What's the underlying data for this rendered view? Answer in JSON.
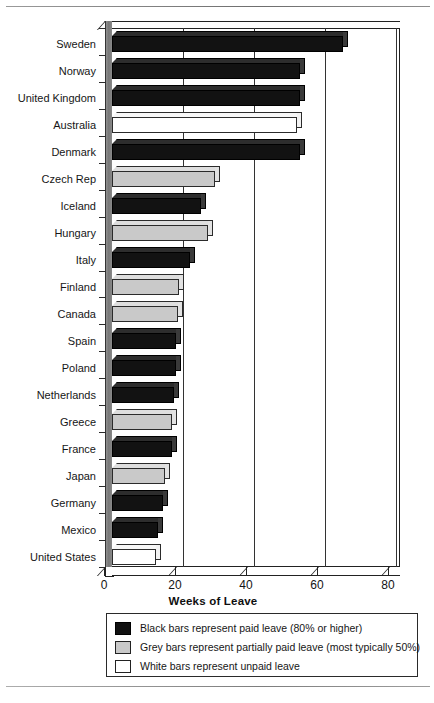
{
  "chart_data": {
    "type": "bar",
    "orientation": "horizontal",
    "title": "",
    "xlabel": "Weeks of Leave",
    "ylabel": "",
    "xlim": [
      0,
      80
    ],
    "xticks": [
      0,
      20,
      40,
      60,
      80
    ],
    "grid": "vertical",
    "legend_position": "below-axis",
    "categories": [
      "Sweden",
      "Norway",
      "United Kingdom",
      "Australia",
      "Denmark",
      "Czech Rep",
      "Iceland",
      "Hungary",
      "Italy",
      "Finland",
      "Canada",
      "Spain",
      "Poland",
      "Netherlands",
      "Greece",
      "France",
      "Japan",
      "Germany",
      "Mexico",
      "United States"
    ],
    "values": [
      65,
      53,
      53,
      52,
      53,
      29,
      25,
      27,
      22,
      19,
      18.5,
      18,
      18,
      17.5,
      17,
      17,
      15,
      14.5,
      13,
      12.5
    ],
    "bar_types": [
      "black",
      "black",
      "black",
      "white",
      "black",
      "grey",
      "black",
      "grey",
      "black",
      "grey",
      "grey",
      "black",
      "black",
      "black",
      "grey",
      "black",
      "grey",
      "black",
      "black",
      "white"
    ],
    "series": [
      {
        "name": "Black bars represent paid leave (80% or higher)",
        "color": "#121212"
      },
      {
        "name": "Grey bars represent partially paid leave (most typically 50%)",
        "color": "#c9c9c9"
      },
      {
        "name": "White bars represent unpaid leave",
        "color": "#ffffff"
      }
    ]
  },
  "axis": {
    "x_title": "Weeks of Leave",
    "tick_labels": [
      "0",
      "20",
      "40",
      "60",
      "80"
    ]
  },
  "legend": {
    "rows": [
      {
        "swatch": "black",
        "label": "Black bars represent paid leave (80% or higher)"
      },
      {
        "swatch": "grey",
        "label": "Grey bars represent partially paid leave (most typically 50%)"
      },
      {
        "swatch": "white",
        "label": "White bars represent unpaid leave"
      }
    ]
  }
}
